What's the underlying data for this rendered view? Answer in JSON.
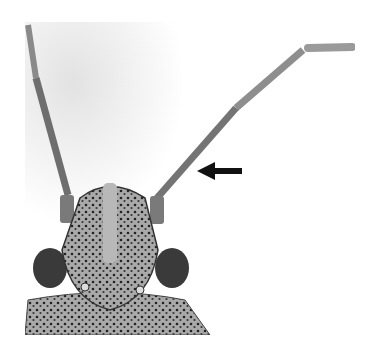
{
  "image": {
    "subject": "insect head with antennae (dorsal view)",
    "style": "grayscale micrograph",
    "annotation": {
      "type": "arrow",
      "direction": "left",
      "points_to": "right antenna segment"
    },
    "colors": {
      "background": "#ffffff",
      "wash": "#e6e6e6",
      "body": "#9a9a9a",
      "dark": "#222222",
      "arrow": "#111111"
    }
  }
}
